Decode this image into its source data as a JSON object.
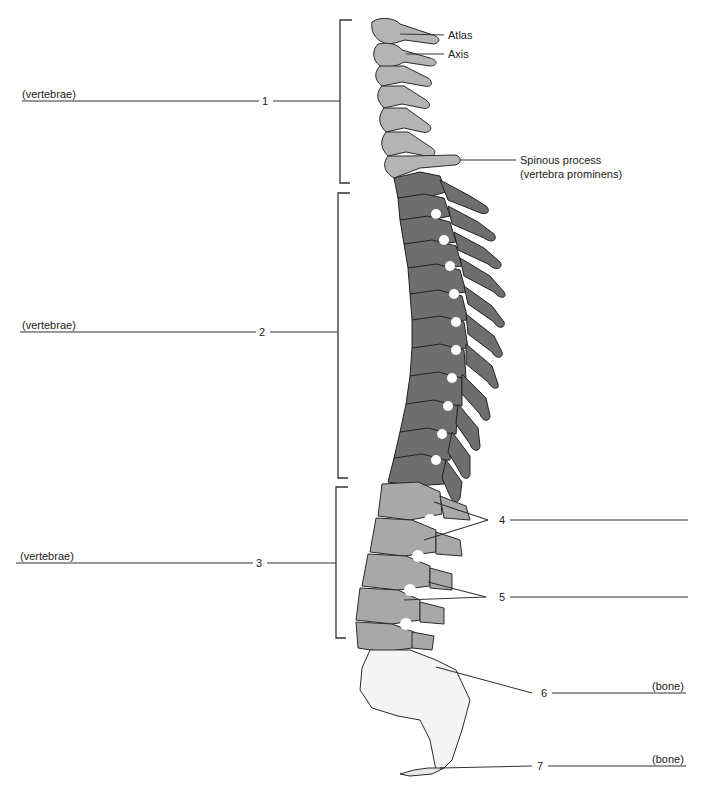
{
  "diagram": {
    "colors": {
      "cervical": "#b4b4b4",
      "thoracic": "#6e6e6e",
      "lumbar": "#a8a8a8",
      "sacrum": "#f4f4f4",
      "outline": "#2a2a2a",
      "leader": "#333333"
    },
    "left_labels": [
      {
        "number": "1",
        "blank_hint": "(vertebrae)"
      },
      {
        "number": "2",
        "blank_hint": "(vertebrae)"
      },
      {
        "number": "3",
        "blank_hint": "(vertebrae)"
      }
    ],
    "right_labels": [
      {
        "number": "4",
        "blank_hint": ""
      },
      {
        "number": "5",
        "blank_hint": ""
      },
      {
        "number": "6",
        "blank_hint": "(bone)"
      },
      {
        "number": "7",
        "blank_hint": "(bone)"
      }
    ],
    "callouts": {
      "atlas": "Atlas",
      "axis": "Axis",
      "spinous_line1": "Spinous process",
      "spinous_line2": "(vertebra prominens)"
    }
  }
}
